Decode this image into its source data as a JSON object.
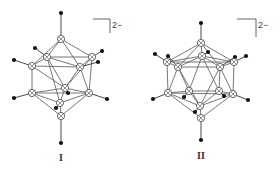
{
  "figure": {
    "structures": [
      {
        "id": "I",
        "label": "I",
        "charge": "2−",
        "boron_atoms": 12,
        "hydrogen_atoms": 12
      },
      {
        "id": "II",
        "label": "II",
        "charge": "2−",
        "boron_atoms": 12,
        "hydrogen_atoms": 12
      }
    ],
    "legend": {
      "boron_symbol": "circled-cross",
      "hydrogen_symbol": "filled-dot"
    },
    "colors": {
      "line": "#555555",
      "atom": "#444444",
      "hydrogen": "#111111",
      "background": "#ffffff"
    }
  }
}
